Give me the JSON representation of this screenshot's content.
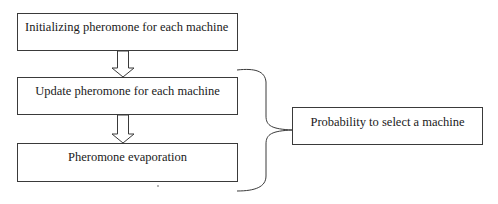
{
  "diagram": {
    "type": "flowchart",
    "nodes": [
      {
        "id": "init",
        "label": "Initializing pheromone for each machine"
      },
      {
        "id": "update",
        "label": "Update pheromone for each machine"
      },
      {
        "id": "evap",
        "label": "Pheromone evaporation"
      },
      {
        "id": "prob",
        "label": "Probability to select a machine"
      }
    ],
    "edges": [
      {
        "from": "init",
        "to": "update",
        "style": "hollow-arrow"
      },
      {
        "from": "update",
        "to": "evap",
        "style": "hollow-arrow"
      }
    ],
    "groupings": [
      {
        "members": [
          "update",
          "evap"
        ],
        "style": "curly-brace",
        "points_to": "prob"
      }
    ]
  }
}
